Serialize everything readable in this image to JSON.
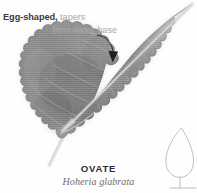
{
  "figure": {
    "kind": "botanical-leaf-shape-plate",
    "background_color": "#fefefe"
  },
  "annotation": {
    "emphasis_text": "Egg-shaped,",
    "rest_text": " tapers",
    "line2_text": "from wider base",
    "emphasis_color": "#3b3b3b",
    "muted_color": "#a9a9a9",
    "leader_line": "curved leader from text to leaf blade",
    "arrow": "curved-arrow-down-right"
  },
  "caption": {
    "common_name": "OVATE",
    "scientific_name": "Hoheria glabrata",
    "common_color": "#2f2f2f",
    "scientific_color": "#6c6c6c"
  },
  "leaf": {
    "shape": "ovate",
    "margin": "crenate-scalloped",
    "apex": "acuminate",
    "base": "rounded-wide",
    "venation": "pinnate-with-pale-midrib",
    "blade_color": "#8d8d8d",
    "blade_shadow_color": "#6f6f6f",
    "midrib_color": "#cfcfcf",
    "petiole_color": "#dcdcdc"
  },
  "outline_diagram": {
    "label": "ovate-outline-silhouette",
    "stroke_color": "#b9b9b9",
    "description": "small line-drawing of the ovate outline with stem and base bar"
  }
}
